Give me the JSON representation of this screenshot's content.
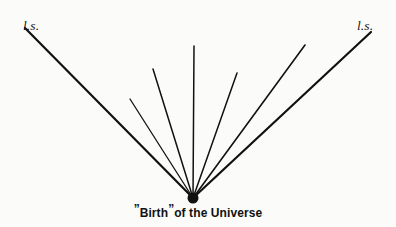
{
  "figure": {
    "background_color": "#fbfbf9",
    "ink_color": "#111111",
    "width": 396,
    "height": 227,
    "labels": {
      "left": "l.s.",
      "right": "l.s."
    },
    "caption": {
      "open_quote": "”",
      "word": "Birth",
      "close_quote": "”",
      "rest": "of the Universe",
      "full_text": "”Birth”of the Universe"
    }
  },
  "chart_data": {
    "type": "line",
    "title": "",
    "xlabel": "",
    "ylabel": "",
    "grid": false,
    "legend": null,
    "xlim": [
      0,
      396
    ],
    "ylim": [
      227,
      0
    ],
    "annotations": [
      {
        "text": "l.s.",
        "x": 25,
        "y": 27,
        "style": "italic-serif"
      },
      {
        "text": "l.s.",
        "x": 368,
        "y": 27,
        "style": "italic-serif"
      },
      {
        "text": "”Birth”of the Universe",
        "x": 196,
        "y": 213,
        "style": "bold-sans"
      }
    ],
    "origin": {
      "x": 193,
      "y": 198,
      "marker": "filled-blob",
      "marker_radius": 5.5
    },
    "series": [
      {
        "name": "worldline-1",
        "x": [
          193,
          25
        ],
        "y": [
          198,
          28
        ],
        "width": 2.2
      },
      {
        "name": "worldline-2",
        "x": [
          193,
          130
        ],
        "y": [
          198,
          99
        ],
        "width": 1.3
      },
      {
        "name": "worldline-3",
        "x": [
          193,
          153
        ],
        "y": [
          198,
          69
        ],
        "width": 1.5
      },
      {
        "name": "worldline-4",
        "x": [
          193,
          194
        ],
        "y": [
          198,
          46
        ],
        "width": 1.5
      },
      {
        "name": "worldline-5",
        "x": [
          193,
          237
        ],
        "y": [
          198,
          73
        ],
        "width": 1.5
      },
      {
        "name": "worldline-6",
        "x": [
          193,
          305
        ],
        "y": [
          198,
          45
        ],
        "width": 1.6
      },
      {
        "name": "worldline-7",
        "x": [
          193,
          371
        ],
        "y": [
          198,
          32
        ],
        "width": 2.2
      }
    ]
  }
}
